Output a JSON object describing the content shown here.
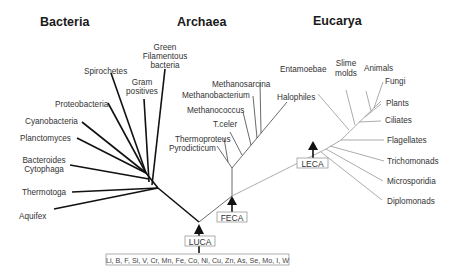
{
  "diagram": {
    "type": "phylogenetic-tree",
    "domains": [
      {
        "name": "Bacteria",
        "color": "#111111"
      },
      {
        "name": "Archaea",
        "color": "#444444"
      },
      {
        "name": "Eucarya",
        "color": "#888888"
      }
    ],
    "bacteria": {
      "taxa": [
        "Green",
        "Filamentous",
        "bacteria",
        "Spirochetes",
        "Gram",
        "positives",
        "Proteobacteria",
        "Cyanobacteria",
        "Planctomyces",
        "Bacteroides",
        "Cytophaga",
        "Thermotoga",
        "Aquifex"
      ]
    },
    "archaea": {
      "taxa": [
        "Methanosarcina",
        "Methanobacterium",
        "Halophiles",
        "Methanococcus",
        "T.celer",
        "Thermoproteus",
        "Pyrodicticum"
      ]
    },
    "eucarya": {
      "taxa": [
        "Entamoebae",
        "Slime",
        "molds",
        "Animals",
        "Fungi",
        "Plants",
        "Ciliates",
        "Flagellates",
        "Trichomonads",
        "Microsporidia",
        "Diplomonads"
      ]
    },
    "ancestors": {
      "luca": "LUCA",
      "feca": "FECA",
      "leca": "LECA"
    },
    "elements": "Li, B, F, Si, V, Cr, Mn, Fe, Co, Ni, Cu, Zn, As, Se, Mo, I, W"
  }
}
